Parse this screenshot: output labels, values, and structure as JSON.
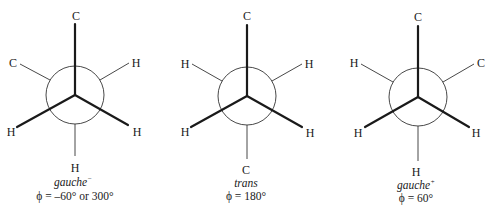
{
  "figure": {
    "type": "Newman projections of butane conformers",
    "projections": [
      {
        "id": "gauche-minus",
        "center": [
          75,
          95
        ],
        "radius": 29,
        "front": {
          "top": {
            "label": "C",
            "pos": [
              76,
              16
            ]
          },
          "lower_left": {
            "label": "H",
            "pos": [
              12,
              132
            ]
          },
          "lower_right": {
            "label": "H",
            "pos": [
              137,
              132
            ]
          }
        },
        "back": {
          "upper_left": {
            "label": "C",
            "pos": [
              13,
              63
            ]
          },
          "upper_right": {
            "label": "H",
            "pos": [
              136,
              63
            ]
          },
          "bottom": {
            "label": "H",
            "pos": [
              75,
              170
            ]
          }
        },
        "name": "gauche",
        "name_superscript": "−",
        "angle": "ϕ = –60° or 300°"
      },
      {
        "id": "trans",
        "center": [
          247,
          96
        ],
        "radius": 29,
        "front": {
          "top": {
            "label": "C",
            "pos": [
              247,
              16
            ]
          },
          "lower_left": {
            "label": "H",
            "pos": [
              185,
              132
            ]
          },
          "lower_right": {
            "label": "H",
            "pos": [
              310,
              132
            ]
          }
        },
        "back": {
          "upper_left": {
            "label": "H",
            "pos": [
              185,
              64
            ]
          },
          "upper_right": {
            "label": "H",
            "pos": [
              309,
              64
            ]
          },
          "bottom": {
            "label": "C",
            "pos": [
              246,
              172
            ]
          }
        },
        "name": "trans",
        "name_superscript": "",
        "angle": "ϕ = 180°"
      },
      {
        "id": "gauche-plus",
        "center": [
          418,
          97
        ],
        "radius": 29,
        "front": {
          "top": {
            "label": "C",
            "pos": [
              418,
              17
            ]
          },
          "lower_left": {
            "label": "H",
            "pos": [
              359,
              133
            ]
          },
          "lower_right": {
            "label": "H",
            "pos": [
              476,
              133
            ]
          }
        },
        "back": {
          "upper_left": {
            "label": "H",
            "pos": [
              354,
              63
            ]
          },
          "upper_right": {
            "label": "C",
            "pos": [
              481,
              63
            ]
          },
          "bottom": {
            "label": "H",
            "pos": [
              416,
              174
            ]
          }
        },
        "name": "gauche",
        "name_superscript": "+",
        "angle": "ϕ = 60°"
      }
    ]
  }
}
